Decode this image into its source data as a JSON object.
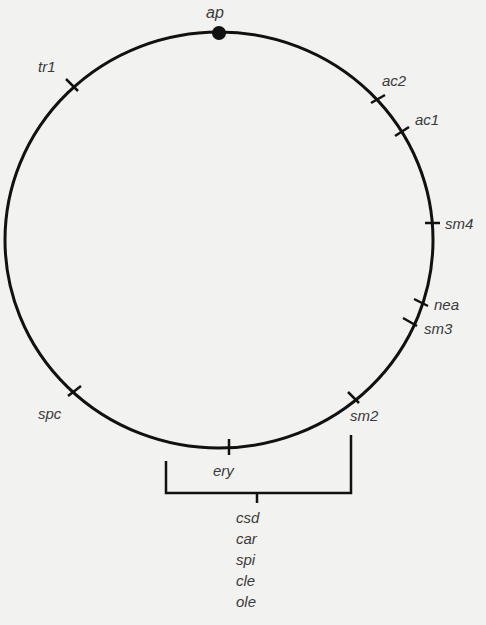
{
  "diagram": {
    "type": "circular genetic linkage map",
    "origin_marker": "ap",
    "markers": [
      {
        "id": "ap",
        "label": "ap",
        "x": 219,
        "y": 32,
        "dot": true
      },
      {
        "id": "tr1",
        "label": "tr1",
        "x": 72,
        "y": 85
      },
      {
        "id": "ac2",
        "label": "ac2",
        "x": 378,
        "y": 99
      },
      {
        "id": "ac1",
        "label": "ac1",
        "x": 402,
        "y": 131
      },
      {
        "id": "sm4",
        "label": "sm4",
        "x": 432,
        "y": 223
      },
      {
        "id": "nea",
        "label": "nea",
        "x": 421,
        "y": 303
      },
      {
        "id": "sm3",
        "label": "sm3",
        "x": 410,
        "y": 322
      },
      {
        "id": "sm2",
        "label": "sm2",
        "x": 354,
        "y": 398
      },
      {
        "id": "ery",
        "label": "ery",
        "x": 229,
        "y": 447
      },
      {
        "id": "spc",
        "label": "spc",
        "x": 75,
        "y": 391
      }
    ],
    "cluster_bracket": {
      "spans": [
        "ery",
        "sm2"
      ],
      "grouped_labels": [
        "csd",
        "car",
        "spi",
        "cle",
        "ole"
      ]
    }
  },
  "labels": {
    "ap": "ap",
    "tr1": "tr1",
    "ac2": "ac2",
    "ac1": "ac1",
    "sm4": "sm4",
    "nea": "nea",
    "sm3": "sm3",
    "sm2": "sm2",
    "ery": "ery",
    "spc": "spc",
    "cluster": [
      "csd",
      "car",
      "spi",
      "cle",
      "ole"
    ]
  },
  "colors": {
    "line": "#111111",
    "text": "#3a3a3a",
    "background": "#f2f2f0"
  }
}
